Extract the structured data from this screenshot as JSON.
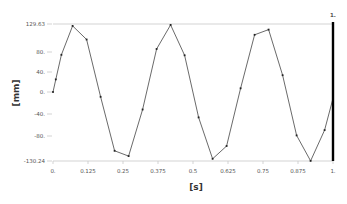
{
  "chart_data": {
    "type": "line",
    "title": "",
    "xlabel": "[s]",
    "ylabel": "[mm]",
    "xlim": [
      0,
      1
    ],
    "ylim": [
      -130.24,
      129.63
    ],
    "grid": false,
    "legend": null,
    "x_ticks": [
      "0.",
      "0.125",
      "0.25",
      "0.375",
      "0.5",
      "0.625",
      "0.75",
      "0.875",
      "1."
    ],
    "y_ticks": [
      "129.63",
      "80.",
      "40.",
      "0.",
      "-40.",
      "-80.",
      "-130.24"
    ],
    "cursor_label": "1.",
    "cursor_x": 1.0,
    "series": [
      {
        "name": "displacement",
        "color": "#444444",
        "x": [
          0.0,
          0.01,
          0.03,
          0.07,
          0.12,
          0.17,
          0.22,
          0.27,
          0.32,
          0.37,
          0.42,
          0.47,
          0.52,
          0.57,
          0.62,
          0.67,
          0.72,
          0.77,
          0.82,
          0.87,
          0.92,
          0.97,
          1.0
        ],
        "values": [
          0,
          24,
          71,
          126,
          100,
          -9,
          -111,
          -121,
          -33,
          82,
          128,
          70,
          -48,
          -126,
          -102,
          7,
          109,
          119,
          32,
          -82,
          -130,
          -72,
          -12
        ]
      }
    ]
  }
}
